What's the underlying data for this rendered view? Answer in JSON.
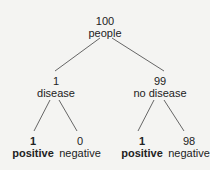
{
  "tree": {
    "root": {
      "count": "100",
      "label": "people"
    },
    "branches": [
      {
        "count": "1",
        "label": "disease",
        "leaves": [
          {
            "count": "1",
            "label": "positive",
            "emphasis": true
          },
          {
            "count": "0",
            "label": "negative",
            "emphasis": false
          }
        ]
      },
      {
        "count": "99",
        "label": "no disease",
        "leaves": [
          {
            "count": "1",
            "label": "positive",
            "emphasis": true
          },
          {
            "count": "98",
            "label": "negative",
            "emphasis": false
          }
        ]
      }
    ]
  },
  "colors": {
    "background": "#f4f4f2",
    "line": "#666666",
    "text": "#222222"
  }
}
